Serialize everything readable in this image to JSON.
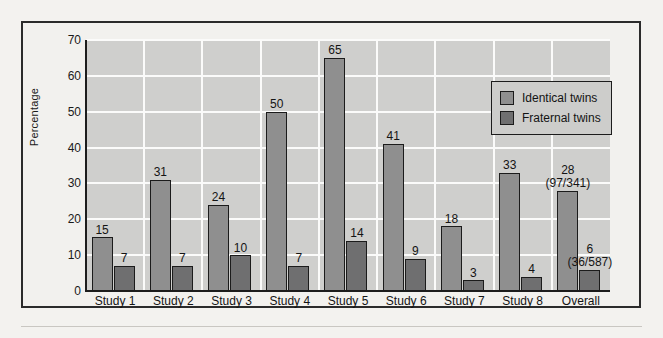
{
  "chart_data": {
    "type": "bar",
    "title": "",
    "xlabel": "",
    "ylabel": "Percentage",
    "ylim": [
      0,
      70
    ],
    "yticks": [
      "0",
      "10",
      "20",
      "30",
      "40",
      "50",
      "60",
      "70"
    ],
    "grid": "horizontal-and-vertical-white-gridlines",
    "legend_position": "top-right-inside-plot",
    "categories": [
      "Study 1",
      "Study 2",
      "Study 3",
      "Study 4",
      "Study 5",
      "Study 6",
      "Study 7",
      "Study 8",
      "Overall"
    ],
    "series": [
      {
        "name": "Identical twins",
        "color": "#8f8f8f",
        "values": [
          15,
          31,
          24,
          50,
          65,
          41,
          18,
          33,
          28
        ],
        "labels": [
          "15",
          "31",
          "24",
          "50",
          "65",
          "41",
          "18",
          "33",
          "28"
        ],
        "sublabels": [
          "",
          "",
          "",
          "",
          "",
          "",
          "",
          "",
          "(97/341)"
        ]
      },
      {
        "name": "Fraternal twins",
        "color": "#6f6f70",
        "values": [
          7,
          7,
          10,
          7,
          14,
          9,
          3,
          4,
          6
        ],
        "labels": [
          "7",
          "7",
          "10",
          "7",
          "14",
          "9",
          "3",
          "4",
          "6"
        ],
        "sublabels": [
          "",
          "",
          "",
          "",
          "",
          "",
          "",
          "",
          "(36/587)"
        ]
      }
    ]
  },
  "legend": {
    "items": [
      {
        "label": "Identical twins",
        "swatch": "identical-twins-swatch"
      },
      {
        "label": "Fraternal twins",
        "swatch": "fraternal-twins-swatch"
      }
    ]
  },
  "colors": {
    "identical_twins": "#8f8f8f",
    "fraternal_twins": "#6f6f70",
    "plot_background": "#cfcfcd",
    "gridline": "#fbfbfa",
    "axis": "#1d1d1d",
    "page_background": "#f3f2ef"
  }
}
